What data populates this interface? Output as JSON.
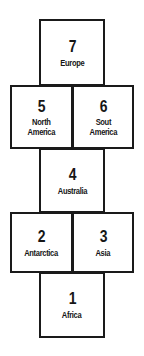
{
  "diagram": {
    "type": "hopscotch-grid",
    "line_color": "#1a1a1a",
    "background_color": "#ffffff",
    "text_color": "#161616",
    "cells": [
      {
        "number": "7",
        "label_lines": [
          "Europe"
        ],
        "name": "europe"
      },
      {
        "number": "5",
        "label_lines": [
          "North",
          "America"
        ],
        "name": "north-america"
      },
      {
        "number": "6",
        "label_lines": [
          "Sout",
          "America"
        ],
        "name": "south-america"
      },
      {
        "number": "4",
        "label_lines": [
          "Australia"
        ],
        "name": "australia"
      },
      {
        "number": "2",
        "label_lines": [
          "Antarctica"
        ],
        "name": "antarctica"
      },
      {
        "number": "3",
        "label_lines": [
          "Asia"
        ],
        "name": "asia"
      },
      {
        "number": "1",
        "label_lines": [
          "Africa"
        ],
        "name": "africa"
      }
    ]
  }
}
